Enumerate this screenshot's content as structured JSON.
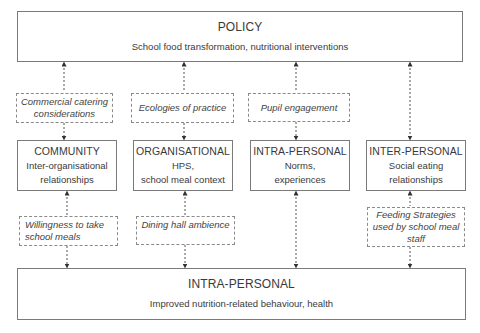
{
  "policy": {
    "title": "POLICY",
    "subtitle": "School food transformation, nutritional interventions"
  },
  "mediators_top": [
    {
      "text": "Commercial catering considerations"
    },
    {
      "text": "Ecologies of practice"
    },
    {
      "text": "Pupil engagement"
    }
  ],
  "levels": [
    {
      "title": "COMMUNITY",
      "lines": [
        "Inter-organisational",
        "relationships"
      ]
    },
    {
      "title": "ORGANISATIONAL",
      "lines": [
        "HPS,",
        "school meal context"
      ]
    },
    {
      "title": "INTRA-PERSONAL",
      "lines": [
        "Norms,",
        "experiences"
      ]
    },
    {
      "title": "INTER-PERSONAL",
      "lines": [
        "Social eating",
        "relationships"
      ]
    }
  ],
  "mediators_bottom": [
    {
      "text": "Willingness to take school meals"
    },
    {
      "text": "Dining hall ambience"
    },
    {
      "text": "Feeding Strategies used by school meal staff"
    }
  ],
  "outcome": {
    "title": "INTRA-PERSONAL",
    "subtitle": "Improved nutrition-related behaviour, health"
  },
  "colors": {
    "border": "#7a7a7a",
    "text": "#3a3a3a",
    "background": "#ffffff"
  }
}
